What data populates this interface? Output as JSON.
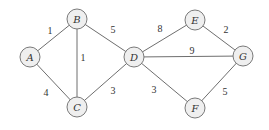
{
  "graph": {
    "type": "weighted-undirected",
    "colors": {
      "node_fill": "#efefef",
      "node_stroke": "#7a7a7a",
      "edge": "#6e6e6e",
      "text": "#333333"
    },
    "nodes": [
      {
        "id": "A",
        "label": "A",
        "x": 30,
        "y": 57
      },
      {
        "id": "B",
        "label": "B",
        "x": 77,
        "y": 19
      },
      {
        "id": "C",
        "label": "C",
        "x": 77,
        "y": 107
      },
      {
        "id": "D",
        "label": "D",
        "x": 134,
        "y": 57
      },
      {
        "id": "E",
        "label": "E",
        "x": 195,
        "y": 20
      },
      {
        "id": "F",
        "label": "F",
        "x": 195,
        "y": 108
      },
      {
        "id": "G",
        "label": "G",
        "x": 243,
        "y": 56
      }
    ],
    "edges": [
      {
        "from": "A",
        "to": "B",
        "weight": "1",
        "lx": 50,
        "ly": 30
      },
      {
        "from": "A",
        "to": "C",
        "weight": "4",
        "lx": 46,
        "ly": 92
      },
      {
        "from": "B",
        "to": "C",
        "weight": "1",
        "lx": 83,
        "ly": 57
      },
      {
        "from": "B",
        "to": "D",
        "weight": "5",
        "lx": 113,
        "ly": 29
      },
      {
        "from": "C",
        "to": "D",
        "weight": "3",
        "lx": 113,
        "ly": 90
      },
      {
        "from": "D",
        "to": "E",
        "weight": "8",
        "lx": 160,
        "ly": 28
      },
      {
        "from": "D",
        "to": "G",
        "weight": "9",
        "lx": 192,
        "ly": 50
      },
      {
        "from": "D",
        "to": "F",
        "weight": "3",
        "lx": 154,
        "ly": 89
      },
      {
        "from": "E",
        "to": "G",
        "weight": "2",
        "lx": 226,
        "ly": 29
      },
      {
        "from": "F",
        "to": "G",
        "weight": "5",
        "lx": 225,
        "ly": 91
      }
    ]
  }
}
